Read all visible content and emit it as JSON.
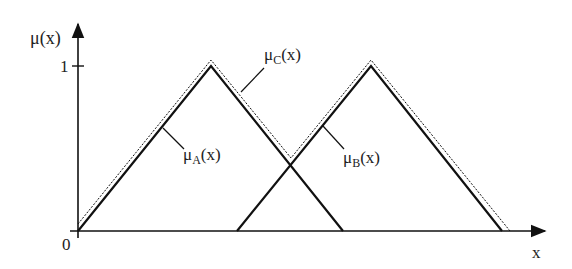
{
  "diagram": {
    "y_axis_label": "μ(x)",
    "x_axis_label": "x",
    "origin_label": "0",
    "y_tick_label": "1",
    "curves": [
      {
        "id": "A",
        "label_main": "μ",
        "label_sub": "A",
        "label_tail": "(x)",
        "style": "solid",
        "points": [
          [
            0,
            0
          ],
          [
            0.5,
            1
          ],
          [
            1,
            0
          ]
        ]
      },
      {
        "id": "B",
        "label_main": "μ",
        "label_sub": "B",
        "label_tail": "(x)",
        "style": "solid",
        "points": [
          [
            0.6,
            0
          ],
          [
            1.1,
            1
          ],
          [
            1.6,
            0
          ]
        ]
      },
      {
        "id": "C",
        "label_main": "μ",
        "label_sub": "C",
        "label_tail": "(x)",
        "style": "dotted",
        "description": "union max(A,B)"
      }
    ],
    "colors": {
      "line": "#111111",
      "text": "#222222"
    }
  }
}
